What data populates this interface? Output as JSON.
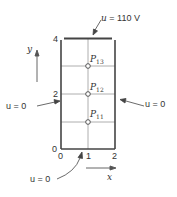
{
  "diagram": {
    "boundary_conditions": {
      "top": "u = 110 V",
      "left": "u = 0",
      "right": "u = 0",
      "bottom": "u = 0"
    },
    "axes": {
      "x_label": "x",
      "y_label": "y",
      "x_ticks": [
        "0",
        "1",
        "2"
      ],
      "y_ticks": [
        "0",
        "2",
        "4"
      ]
    },
    "points": [
      {
        "name": "P",
        "sub": "13"
      },
      {
        "name": "P",
        "sub": "12"
      },
      {
        "name": "P",
        "sub": "11"
      }
    ],
    "colors": {
      "line": "#444444",
      "grid": "#888888"
    }
  }
}
